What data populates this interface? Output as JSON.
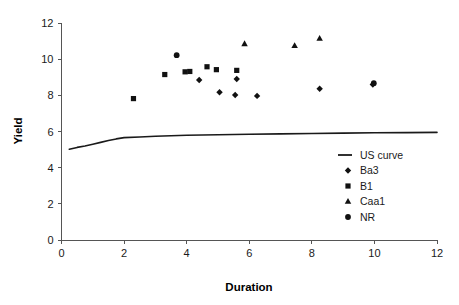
{
  "chart_data": {
    "type": "scatter",
    "title": "",
    "xlabel": "Duration",
    "ylabel": "Yield",
    "xlim": [
      0,
      12
    ],
    "ylim": [
      0,
      12
    ],
    "xticks": [
      0,
      2,
      4,
      6,
      8,
      10,
      12
    ],
    "yticks": [
      0,
      2,
      4,
      6,
      8,
      10,
      12
    ],
    "xtick_labels": [
      "0",
      "2",
      "4",
      "6",
      "8",
      "10",
      "12"
    ],
    "ytick_labels": [
      "0",
      "2",
      "4",
      "6",
      "8",
      "10",
      "12"
    ],
    "grid": false,
    "legend_position": "center-right",
    "series": [
      {
        "name": "US curve",
        "type": "line",
        "marker": "line",
        "color": "#1a1a1a",
        "points": [
          {
            "x": 0.25,
            "y": 5.02
          },
          {
            "x": 0.5,
            "y": 5.12
          },
          {
            "x": 0.75,
            "y": 5.2
          },
          {
            "x": 1.0,
            "y": 5.3
          },
          {
            "x": 1.25,
            "y": 5.4
          },
          {
            "x": 1.5,
            "y": 5.5
          },
          {
            "x": 1.75,
            "y": 5.59
          },
          {
            "x": 2.0,
            "y": 5.66
          },
          {
            "x": 2.5,
            "y": 5.7
          },
          {
            "x": 3.0,
            "y": 5.74
          },
          {
            "x": 4.0,
            "y": 5.79
          },
          {
            "x": 5.0,
            "y": 5.82
          },
          {
            "x": 6.0,
            "y": 5.85
          },
          {
            "x": 7.0,
            "y": 5.87
          },
          {
            "x": 8.0,
            "y": 5.89
          },
          {
            "x": 9.0,
            "y": 5.91
          },
          {
            "x": 10.0,
            "y": 5.93
          },
          {
            "x": 11.0,
            "y": 5.94
          },
          {
            "x": 12.0,
            "y": 5.95
          }
        ]
      },
      {
        "name": "Ba3",
        "type": "scatter",
        "marker": "diamond",
        "color": "#111111",
        "points": [
          {
            "x": 4.4,
            "y": 8.85
          },
          {
            "x": 5.05,
            "y": 8.17
          },
          {
            "x": 5.55,
            "y": 8.02
          },
          {
            "x": 5.6,
            "y": 8.9
          },
          {
            "x": 6.25,
            "y": 7.97
          },
          {
            "x": 8.25,
            "y": 8.36
          },
          {
            "x": 9.95,
            "y": 8.6
          }
        ]
      },
      {
        "name": "B1",
        "type": "scatter",
        "marker": "square",
        "color": "#111111",
        "points": [
          {
            "x": 2.3,
            "y": 7.82
          },
          {
            "x": 3.3,
            "y": 9.15
          },
          {
            "x": 3.95,
            "y": 9.3
          },
          {
            "x": 4.1,
            "y": 9.32
          },
          {
            "x": 4.65,
            "y": 9.58
          },
          {
            "x": 4.95,
            "y": 9.42
          },
          {
            "x": 5.6,
            "y": 9.38
          }
        ]
      },
      {
        "name": "Caa1",
        "type": "scatter",
        "marker": "triangle",
        "color": "#111111",
        "points": [
          {
            "x": 5.85,
            "y": 10.85
          },
          {
            "x": 7.45,
            "y": 10.75
          },
          {
            "x": 8.25,
            "y": 11.15
          }
        ]
      },
      {
        "name": "NR",
        "type": "scatter",
        "marker": "circle",
        "color": "#111111",
        "points": [
          {
            "x": 3.68,
            "y": 10.22
          },
          {
            "x": 9.98,
            "y": 8.67
          }
        ]
      }
    ],
    "legend_entries": [
      {
        "label": "US curve",
        "marker": "line"
      },
      {
        "label": "Ba3",
        "marker": "diamond"
      },
      {
        "label": "B1",
        "marker": "square"
      },
      {
        "label": "Caa1",
        "marker": "triangle"
      },
      {
        "label": "NR",
        "marker": "circle"
      }
    ]
  }
}
